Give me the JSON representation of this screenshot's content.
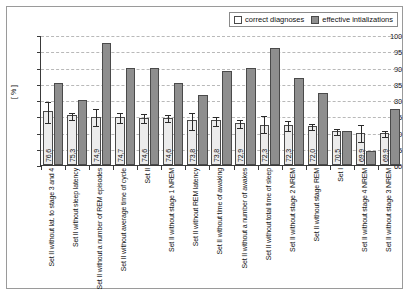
{
  "legend": {
    "items": [
      {
        "label": "correct diagnoses",
        "swatch": "white",
        "color": "#ffffff"
      },
      {
        "label": "effective intializations",
        "swatch": "gray",
        "color": "#8e8e8e"
      }
    ]
  },
  "chart_data": {
    "type": "bar",
    "title": "",
    "xlabel": "",
    "ylabel": "[ % ]",
    "ylim": [
      60,
      100
    ],
    "ytick_step": 5,
    "yticks": [
      "100",
      "95",
      "90",
      "85",
      "80",
      "75",
      "70",
      "65",
      "60"
    ],
    "grid": true,
    "legend_position": "top-right",
    "categories": [
      "Set II without lat. to stage 3 and 4",
      "Set II without sleep latency",
      "Set II without a number of REM episodes",
      "Set II without average time of cycle",
      "Set II",
      "Set II without stage 1 NREM",
      "Set II without REM latency",
      "Set II without time of awaking",
      "Set II without a number of awakes",
      "Set II without total time of sleep",
      "Set II without stage 2 NREM",
      "Set II without stage REM",
      "Set I",
      "Set II without stage 4 NREM",
      "Set II without stage 3 NREM"
    ],
    "series": [
      {
        "name": "correct diagnoses",
        "values": [
          76.6,
          75.3,
          74.9,
          74.7,
          74.6,
          74.6,
          73.8,
          73.8,
          72.9,
          72.3,
          72.3,
          72.0,
          70.5,
          69.9,
          69.9
        ],
        "labels": [
          "76,6",
          "75,3",
          "74,9",
          "74,7",
          "74,6",
          "74,6",
          "73,8",
          "73,8",
          "72,9",
          "72,3",
          "72,3",
          "72,0",
          "70,5",
          "69,9",
          "69,9"
        ],
        "err_low": [
          73.3,
          74.3,
          72.2,
          73.1,
          73.3,
          73.5,
          71.2,
          72.4,
          71.6,
          70.2,
          70.9,
          71.2,
          69.6,
          67.3,
          69.0
        ],
        "err_high": [
          79.8,
          76.3,
          77.6,
          76.3,
          75.9,
          75.7,
          76.4,
          75.2,
          74.2,
          75.4,
          73.7,
          72.8,
          71.4,
          72.5,
          70.8
        ]
      },
      {
        "name": "effective intializations",
        "values": [
          85.3,
          80.0,
          97.4,
          90.0,
          90.0,
          85.2,
          81.5,
          88.9,
          89.8,
          96.0,
          86.7,
          82.2,
          70.5,
          64.2,
          77.1
        ],
        "labels": [
          "",
          "",
          "",
          "",
          "",
          "",
          "",
          "",
          "",
          "",
          "",
          "",
          "",
          "",
          ""
        ]
      }
    ]
  }
}
